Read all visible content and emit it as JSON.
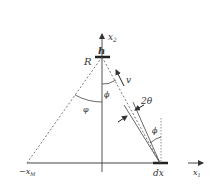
{
  "diagram": {
    "type": "geometry-schematic",
    "colors": {
      "line": "#333333",
      "dashed": "#555555",
      "background": "#ffffff"
    },
    "labels": {
      "x2_axis": "x",
      "x2_sub": "2",
      "x1_axis": "x",
      "x1_sub": "1",
      "h": "h",
      "R": "R",
      "v": "v",
      "phi_top": "ϕ",
      "varphi": "φ",
      "two_theta": "2θ",
      "phi_bottom": "ϕ",
      "dx": "dx",
      "neg_xM": "−x",
      "neg_xM_sub": "M"
    }
  }
}
